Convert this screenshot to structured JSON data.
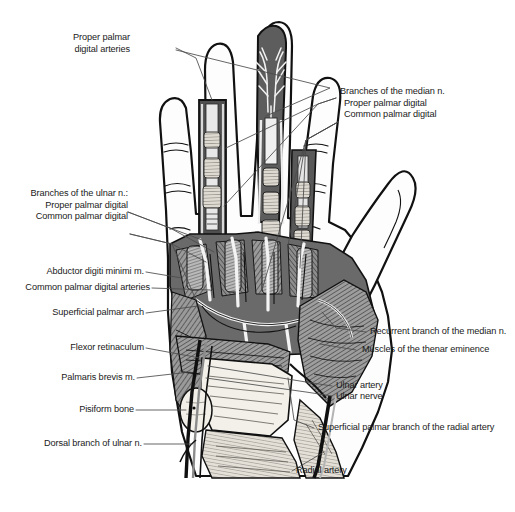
{
  "figure": {
    "background_color": "#ffffff",
    "ink_color": "#1a1a1a",
    "leader_color": "#555555",
    "tone_dark": "#4a4a4a",
    "tone_mid": "#8a8a8a",
    "tone_light": "#d8d8d8",
    "width": 515,
    "height": 512
  },
  "labels": {
    "proper_palmar_digital_arteries": {
      "line1": "Proper palmar",
      "line2": "digital arteries"
    },
    "branches_median": {
      "heading": "Branches of the median n.",
      "item1": "Proper palmar digital",
      "item2": "Common palmar digital"
    },
    "branches_ulnar": {
      "heading": "Branches of the ulnar n.:",
      "item1": "Proper palmar digital",
      "item2": "Common palmar digital"
    },
    "abductor_digiti_minimi": "Abductor digiti minimi m.",
    "common_palmar_digital_arteries": "Common palmar digital arteries",
    "superficial_palmar_arch": "Superficial palmar arch",
    "flexor_retinaculum": "Flexor retinaculum",
    "palmaris_brevis": "Palmaris brevis m.",
    "pisiform_bone": "Pisiform bone",
    "dorsal_branch_ulnar": "Dorsal branch of ulnar n.",
    "recurrent_branch_median": "Recurrent branch of the median n.",
    "muscles_thenar_eminence": "Muscles of the thenar eminence",
    "ulnar_artery": "Ulnar artery",
    "ulnar_nerve": "Ulnar nerve",
    "superficial_palmar_branch_radial": "Superficial palmar branch of the radial artery",
    "radial_artery": "Radial artery"
  }
}
